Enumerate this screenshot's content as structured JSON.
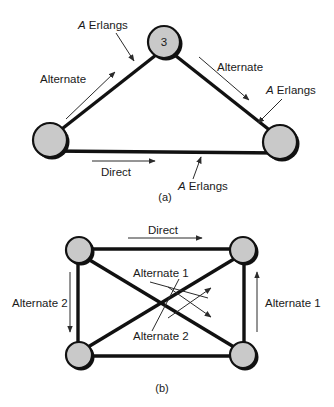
{
  "figure": {
    "panels": [
      {
        "id": "panel-a",
        "caption": "(a)",
        "nodes": [
          {
            "id": "node-top",
            "label": "3"
          },
          {
            "id": "node-left",
            "label": ""
          },
          {
            "id": "node-right",
            "label": ""
          }
        ],
        "labels": {
          "erlangs_upper_left": {
            "italic": "A",
            "rest": " Erlangs"
          },
          "alternate_left": "Alternate",
          "alternate_right": "Alternate",
          "erlangs_upper_right": {
            "italic": "A",
            "rest": " Erlangs"
          },
          "direct": "Direct",
          "erlangs_bottom": {
            "italic": "A",
            "rest": " Erlangs"
          }
        }
      },
      {
        "id": "panel-b",
        "caption": "(b)",
        "nodes": [
          {
            "id": "node-tl",
            "label": ""
          },
          {
            "id": "node-tr",
            "label": ""
          },
          {
            "id": "node-bl",
            "label": ""
          },
          {
            "id": "node-br",
            "label": ""
          }
        ],
        "labels": {
          "direct": "Direct",
          "alternate_1_center": "Alternate 1",
          "alternate_2_center": "Alternate 2",
          "alternate_2_left": "Alternate 2",
          "alternate_1_right": "Alternate 1"
        }
      }
    ],
    "colors": {
      "node_fill": "#c9c9c9",
      "line": "#111111",
      "leader": "#2b2b2b",
      "background": "#ffffff",
      "text": "#1a1a1a"
    }
  }
}
